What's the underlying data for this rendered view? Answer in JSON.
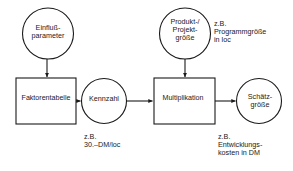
{
  "diagram": {
    "stroke_color": "#1a1a1a",
    "background_color": "#ffffff",
    "nodes": [
      {
        "id": "einflussparameter",
        "shape": "circle",
        "label": "Einfluß-\nparameter"
      },
      {
        "id": "faktorentabelle",
        "shape": "rectangle",
        "label": "Faktorentabelle"
      },
      {
        "id": "kennzahl",
        "shape": "circle",
        "label": "Kennzahl"
      },
      {
        "id": "produkt-projekt-groesse",
        "shape": "circle",
        "label": "Produkt-/\nProjekt-\ngröße"
      },
      {
        "id": "multiplikation",
        "shape": "rectangle",
        "label": "Multiplikation"
      },
      {
        "id": "schaetzgroesse",
        "shape": "circle",
        "label": "Schätz-\ngröße"
      }
    ],
    "captions": [
      {
        "id": "kennzahl-example",
        "text": "z.B.\n30.–DM/loc"
      },
      {
        "id": "programmgroesse-example",
        "text": "z.B.\nProgrammgröße\nin loc"
      },
      {
        "id": "entwicklungskosten-example",
        "text": "z.B.\nEntwicklungs-\nkosten in DM"
      }
    ],
    "edges": [
      {
        "from": "einflussparameter",
        "to": "faktorentabelle",
        "direction": "down"
      },
      {
        "from": "faktorentabelle",
        "to": "kennzahl",
        "direction": "right"
      },
      {
        "from": "kennzahl",
        "to": "multiplikation",
        "direction": "right"
      },
      {
        "from": "produkt-projekt-groesse",
        "to": "multiplikation",
        "direction": "down"
      },
      {
        "from": "multiplikation",
        "to": "schaetzgroesse",
        "direction": "right"
      }
    ]
  }
}
